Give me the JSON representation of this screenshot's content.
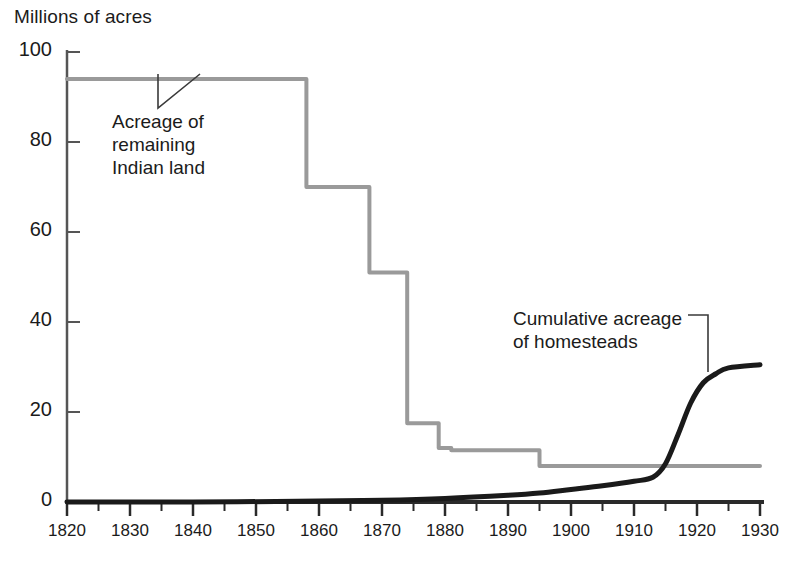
{
  "chart_data": {
    "type": "line",
    "title": "",
    "subtitle": "",
    "ylabel": "Millions of acres",
    "xlabel": "",
    "xlim": [
      1820,
      1930
    ],
    "ylim": [
      0,
      100
    ],
    "grid": false,
    "legend_position": "inline-annotations",
    "xticks": [
      1820,
      1830,
      1840,
      1850,
      1860,
      1870,
      1880,
      1890,
      1900,
      1910,
      1920,
      1930
    ],
    "xticks_minor_interval": 5,
    "yticks": [
      0,
      20,
      40,
      60,
      80,
      100
    ],
    "series": [
      {
        "name": "Acreage of remaining Indian land",
        "color": "#9a9a9a",
        "style": "step",
        "width": 4,
        "x": [
          1820,
          1858,
          1858,
          1868,
          1868,
          1874,
          1874,
          1879,
          1879,
          1881,
          1881,
          1895,
          1895,
          1930
        ],
        "values": [
          94,
          94,
          70,
          70,
          51,
          51,
          17.5,
          17.5,
          12,
          12,
          11.5,
          11.5,
          8,
          8
        ]
      },
      {
        "name": "Cumulative acreage of homesteads",
        "color": "#1a1a1a",
        "style": "smooth",
        "width": 5,
        "x": [
          1820,
          1840,
          1860,
          1870,
          1880,
          1890,
          1895,
          1900,
          1905,
          1910,
          1913,
          1915,
          1917,
          1919,
          1921,
          1923,
          1925,
          1930
        ],
        "values": [
          0,
          0,
          0.2,
          0.4,
          0.8,
          1.5,
          2.0,
          2.8,
          3.6,
          4.6,
          5.5,
          8.5,
          15,
          22,
          26.5,
          28.5,
          29.8,
          30.5
        ]
      }
    ],
    "annotations": [
      {
        "name": "indian-land-label",
        "lines": [
          "Acreage of",
          "remaining",
          "Indian land"
        ],
        "leader": {
          "from_x": 158,
          "from_y": 108,
          "to_x": 158,
          "to_y": 74,
          "elbow_x": 200,
          "elbow_y": 74
        }
      },
      {
        "name": "homesteads-label",
        "lines": [
          "Cumulative acreage",
          "of homesteads"
        ],
        "leader": {
          "from_x": 708,
          "from_y": 315,
          "to_x": 708,
          "to_y": 372,
          "elbow_x": 688,
          "elbow_y": 315
        }
      }
    ]
  },
  "axis": {
    "ylabel": "Millions of acres",
    "yticks": [
      "100",
      "80",
      "60",
      "40",
      "20",
      "0"
    ],
    "xticks": [
      "1820",
      "1830",
      "1840",
      "1850",
      "1860",
      "1870",
      "1880",
      "1890",
      "1900",
      "1910",
      "1920",
      "1930"
    ]
  },
  "annotations": {
    "indian": [
      "Acreage of",
      "remaining",
      "Indian land"
    ],
    "homesteads": [
      "Cumulative acreage",
      "of homesteads"
    ]
  },
  "colors": {
    "indian_land_line": "#9a9a9a",
    "homesteads_line": "#1a1a1a",
    "axis": "#555555",
    "background": "#ffffff",
    "text": "#1b1b1b"
  }
}
